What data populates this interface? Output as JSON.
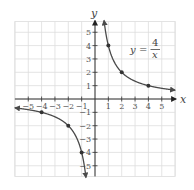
{
  "chart_data": {
    "type": "line",
    "title": "",
    "function": "y = 4/x",
    "annotation": {
      "lhs": "y",
      "equals": "=",
      "numerator": "4",
      "denominator": "x"
    },
    "xlabel": "x",
    "ylabel": "y",
    "xlim": [
      -6,
      6
    ],
    "ylim": [
      -5.8,
      5.8
    ],
    "grid": true,
    "legend": "none",
    "x_ticks": [
      -5,
      -4,
      -3,
      -2,
      -1,
      1,
      2,
      3,
      4,
      5
    ],
    "y_ticks": [
      5,
      4,
      3,
      2,
      1,
      -1,
      -2,
      -3,
      -4,
      -5
    ],
    "x_tick_labels": [
      "−5",
      "−4",
      "−3",
      "−2",
      "−1",
      "1",
      "2",
      "3",
      "4",
      "5"
    ],
    "y_tick_labels": [
      "5",
      "4",
      "3",
      "2",
      "1",
      "−1",
      "−2",
      "−3",
      "−4",
      "−5"
    ],
    "series": [
      {
        "name": "right branch",
        "points": [
          [
            1,
            4
          ],
          [
            2,
            2
          ],
          [
            4,
            1
          ]
        ]
      },
      {
        "name": "left branch",
        "points": [
          [
            -1,
            -4
          ],
          [
            -2,
            -2
          ],
          [
            -4,
            -1
          ]
        ]
      }
    ],
    "colors": {
      "curve": "#4a4a4a",
      "points": "#333333",
      "grid": "#dddddd",
      "axis": "#333333"
    }
  }
}
